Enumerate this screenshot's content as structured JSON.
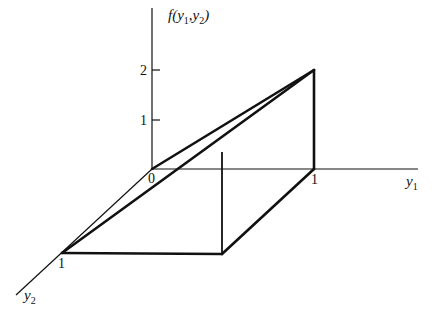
{
  "figure": {
    "axes": {
      "vertical": {
        "label": "f(y",
        "sub1": "1",
        "mid": ",y",
        "sub2": "2",
        "end": ")"
      },
      "y1": {
        "label": "y",
        "sub": "1"
      },
      "y2": {
        "label": "y",
        "sub": "2"
      }
    },
    "ticks": {
      "vertical": [
        "1",
        "2"
      ],
      "origin": "0",
      "y1_one": "1",
      "y2_one": "1"
    },
    "surface": {
      "function": "f(y1,y2) = 2*y1",
      "domain": "0 <= y1 <= 1, 0 <= y2 <= 1",
      "vertices": [
        {
          "name": "origin",
          "y1": 0,
          "y2": 0,
          "f": 0
        },
        {
          "name": "y2-one",
          "y1": 0,
          "y2": 1,
          "f": 0
        },
        {
          "name": "peak-back",
          "y1": 1,
          "y2": 0,
          "f": 2
        },
        {
          "name": "base-back",
          "y1": 1,
          "y2": 0,
          "f": 0
        },
        {
          "name": "base-front",
          "y1": 1,
          "y2": 1,
          "f": 0
        },
        {
          "name": "peak-front",
          "y1": 1,
          "y2": 1,
          "f": 2
        }
      ]
    }
  }
}
